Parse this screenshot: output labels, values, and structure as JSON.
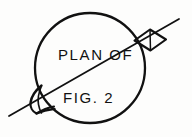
{
  "figure": {
    "kind": "technical-line-drawing",
    "background_color": "#fdfdfc",
    "ink_color": "#111111",
    "caption_line_1": "PLAN OF",
    "caption_line_2": "FIG. 2",
    "labels": {
      "plan_of": "PLAN OF",
      "fig_2": "FIG. 2"
    },
    "geometry": {
      "circle": {
        "center_x": 90,
        "center_y": 68,
        "radius": 55,
        "stroke_width": 2.2
      },
      "section_line": {
        "x1": 9,
        "y1": 116,
        "x2": 179,
        "y2": 19,
        "stroke_width": 1.7
      },
      "tab": {
        "description": "rectangular tab at upper-right rim",
        "points": "136,41 151,31 166,41 151,51"
      },
      "spout": {
        "description": "pointed beak protrusion at lower-left rim",
        "points": "40,86 31,101 36,113 52,109"
      }
    },
    "text_positions": {
      "plan_of_x": 58,
      "plan_of_y": 60,
      "plan_of_size": 15,
      "fig_2_x": 63,
      "fig_2_y": 103,
      "fig_2_size": 15
    }
  }
}
